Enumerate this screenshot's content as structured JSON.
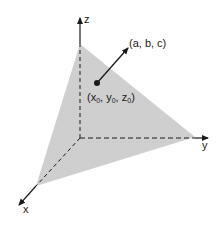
{
  "diagram": {
    "type": "3d-plane-normal-vector",
    "axes": {
      "x_label": "x",
      "y_label": "y",
      "z_label": "z"
    },
    "point": {
      "label_open": "(",
      "x_sym": "x",
      "y_sym": "y",
      "z_sym": "z",
      "subscript": "0",
      "sep": ", ",
      "label_close": ")"
    },
    "normal_vector": {
      "label": "(a, b, c)"
    },
    "colors": {
      "plane_fill": "#cfcfcf",
      "line": "#1a1a1a",
      "background": "#ffffff"
    }
  }
}
